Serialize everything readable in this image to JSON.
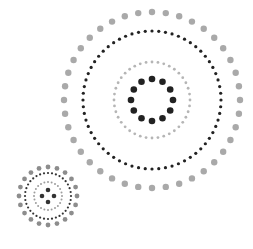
{
  "colors": {
    "background": "#ffffff",
    "gray": "#a6a6a6",
    "light_gray": "#b9b9b9",
    "dark": "#222222"
  },
  "graphics": [
    {
      "name": "large-dotted-rings",
      "cx": 152,
      "cy": 100,
      "rings": [
        {
          "r": 88,
          "count": 40,
          "dot_r": 3.2,
          "color": "#a9a9a9"
        },
        {
          "r": 69,
          "count": 64,
          "dot_r": 1.6,
          "color": "#222222"
        },
        {
          "r": 38,
          "count": 40,
          "dot_r": 1.4,
          "color": "#b5b5b5"
        },
        {
          "r": 21,
          "count": 12,
          "dot_r": 3.3,
          "color": "#222222"
        }
      ]
    },
    {
      "name": "small-dotted-rings",
      "cx": 48,
      "cy": 196,
      "rings": [
        {
          "r": 29,
          "count": 20,
          "dot_r": 2.4,
          "color": "#8d8d8d"
        },
        {
          "r": 23,
          "count": 36,
          "dot_r": 1.1,
          "color": "#333333"
        },
        {
          "r": 14,
          "count": 24,
          "dot_r": 1.0,
          "color": "#9d9d9d"
        },
        {
          "r": 6,
          "count": 4,
          "dot_r": 2.3,
          "color": "#333333"
        }
      ]
    }
  ]
}
